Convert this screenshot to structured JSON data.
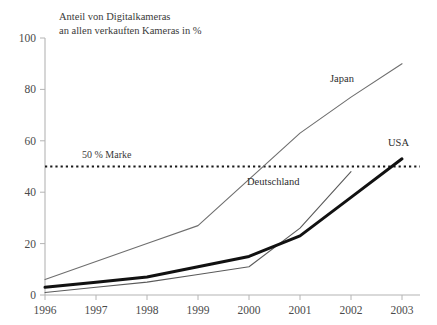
{
  "chart_data": {
    "type": "line",
    "title": "Anteil von Digitalkameras an allen verkauften Kameras in %",
    "title_line1": "Anteil von Digitalkameras",
    "title_line2": "an allen verkauften Kameras in %",
    "xlabel": "",
    "ylabel": "",
    "x": [
      1996,
      1997,
      1998,
      1999,
      2000,
      2001,
      2002,
      2003
    ],
    "categories": [
      "1996",
      "1997",
      "1998",
      "1999",
      "2000",
      "2001",
      "2002",
      "2003"
    ],
    "xlim": [
      1996,
      2003
    ],
    "ylim": [
      0,
      100
    ],
    "yticks": [
      0,
      20,
      40,
      60,
      80,
      100
    ],
    "ytick_labels": [
      "0",
      "20",
      "40",
      "60",
      "80",
      "100"
    ],
    "grid": false,
    "legend": "inline-labels",
    "series": [
      {
        "name": "Japan",
        "label": "Japan",
        "color": "#6e6e6e",
        "width": 1.1,
        "values": [
          6,
          13,
          20,
          27,
          45,
          63,
          77,
          90
        ]
      },
      {
        "name": "USA",
        "label": "USA",
        "color": "#111111",
        "width": 3.0,
        "values": [
          3,
          5,
          7,
          11,
          15,
          23,
          38,
          53
        ]
      },
      {
        "name": "Deutschland",
        "label": "Deutschland",
        "color": "#5a5a5a",
        "width": 1.1,
        "x": [
          1996,
          1997,
          1998,
          1999,
          2000,
          2001,
          2002
        ],
        "values": [
          1,
          3,
          5,
          8,
          11,
          26,
          48
        ]
      }
    ],
    "annotations": [
      {
        "name": "50-percent-line",
        "label": "50 % Marke",
        "type": "hline",
        "value": 50,
        "style": "dotted",
        "color": "#1a1a1a"
      }
    ]
  },
  "axis": {
    "line_color": "#b4b4b4",
    "tick_color": "#b4b4b4"
  }
}
